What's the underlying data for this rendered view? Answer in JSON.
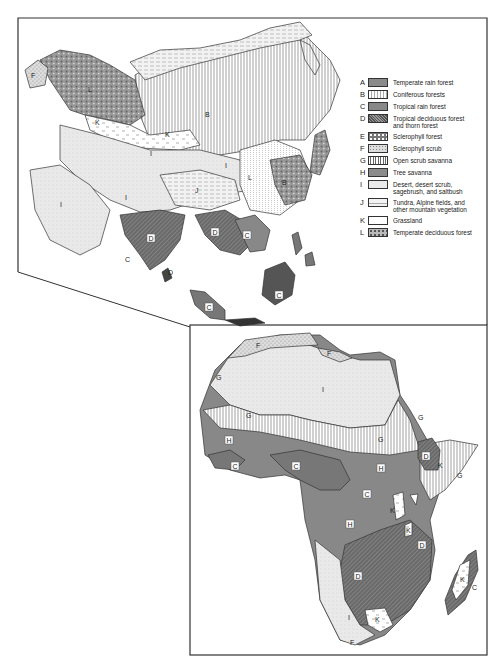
{
  "legend": {
    "items": [
      {
        "key": "A",
        "label": "Temperate rain forest",
        "pattern": "solid-medium-gray"
      },
      {
        "key": "B",
        "label": "Coniferous forests",
        "pattern": "dotted-vertical"
      },
      {
        "key": "C",
        "label": "Tropical rain forest",
        "pattern": "solid-gray"
      },
      {
        "key": "D",
        "label": "Tropical deciduous forest\n  and thorn forest",
        "pattern": "dense-crosshatch"
      },
      {
        "key": "E",
        "label": "Sclerophyll forest",
        "pattern": "white-blobs"
      },
      {
        "key": "F",
        "label": "Sclerophyll scrub",
        "pattern": "speckled"
      },
      {
        "key": "G",
        "label": "Open scrub savanna",
        "pattern": "vertical-lines"
      },
      {
        "key": "H",
        "label": "Tree savanna",
        "pattern": "solid-gray"
      },
      {
        "key": "I",
        "label": "Desert, desert scrub,\n  sagebrush, and saltbush",
        "pattern": "light-stipple"
      },
      {
        "key": "J",
        "label": "Tundra, Alpine fields, and\n  other mountain vegetation",
        "pattern": "horizontal-dashes"
      },
      {
        "key": "K",
        "label": "Grassland",
        "pattern": "sparse-tufts"
      },
      {
        "key": "L",
        "label": "Temperate deciduous forest",
        "pattern": "dark-mottled"
      }
    ]
  },
  "maps": {
    "asia": {
      "region_labels": [
        "L",
        "F",
        "E",
        "K",
        "K",
        "B",
        "J",
        "J",
        "J",
        "I",
        "I",
        "I",
        "I",
        "J",
        "B",
        "B",
        "L",
        "A",
        "B",
        "L",
        "C",
        "D",
        "D",
        "C",
        "C",
        "D",
        "C",
        "C",
        "C",
        "C",
        "C",
        "C",
        "D",
        "C",
        "D",
        "C",
        "C"
      ]
    },
    "africa": {
      "region_labels": [
        "F",
        "F",
        "G",
        "I",
        "G",
        "G",
        "G",
        "H",
        "H",
        "C",
        "C",
        "D",
        "K",
        "G",
        "C",
        "H",
        "K",
        "K",
        "D",
        "D",
        "I",
        "K",
        "F",
        "K",
        "C"
      ]
    }
  },
  "colors": {
    "frame": "#333333",
    "solid_gray": "#8a8a8a",
    "dark": "#555555",
    "light": "#e6e6e6"
  }
}
